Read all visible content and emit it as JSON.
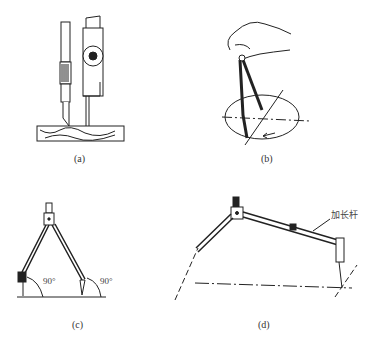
{
  "figures": [
    {
      "id": "a",
      "caption": "(a)",
      "subject": "scriber-and-compass-marking-on-wood"
    },
    {
      "id": "b",
      "caption": "(b)",
      "subject": "hand-holding-compass-drawing-circle"
    },
    {
      "id": "c",
      "caption": "(c)",
      "subject": "compass-legs-perpendicular",
      "angle_labels": [
        "90°",
        "90°"
      ]
    },
    {
      "id": "d",
      "caption": "(d)",
      "subject": "compass-with-extension-rod",
      "callout": "加长杆"
    }
  ],
  "colors": {
    "ink": "#222222",
    "background": "#ffffff"
  }
}
